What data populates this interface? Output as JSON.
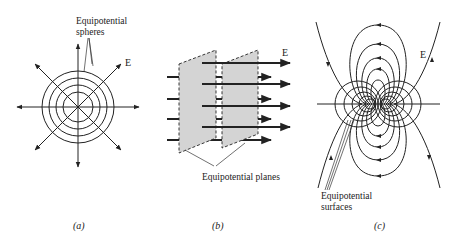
{
  "figure": {
    "panels": [
      {
        "id": "a",
        "caption": "(a)",
        "title": "Point charge",
        "field_label": "E",
        "annotation_line1": "Equipotential",
        "annotation_line2": "spheres",
        "center": [
          78,
          107
        ],
        "circle_radii": [
          15,
          22,
          29,
          36
        ],
        "radial_arrow_count": 8
      },
      {
        "id": "b",
        "caption": "(b)",
        "title": "Uniform field",
        "field_label": "E",
        "annotation": "Equipotential planes",
        "plane_count": 2,
        "arrow_count": 8
      },
      {
        "id": "c",
        "caption": "(c)",
        "title": "Dipole",
        "field_label": "E",
        "annotation_line1": "Equipotential",
        "annotation_line2": "surfaces"
      }
    ]
  },
  "colors": {
    "ink": "#222222",
    "plane_fill": "#d4d4d4",
    "background": "#ffffff"
  }
}
